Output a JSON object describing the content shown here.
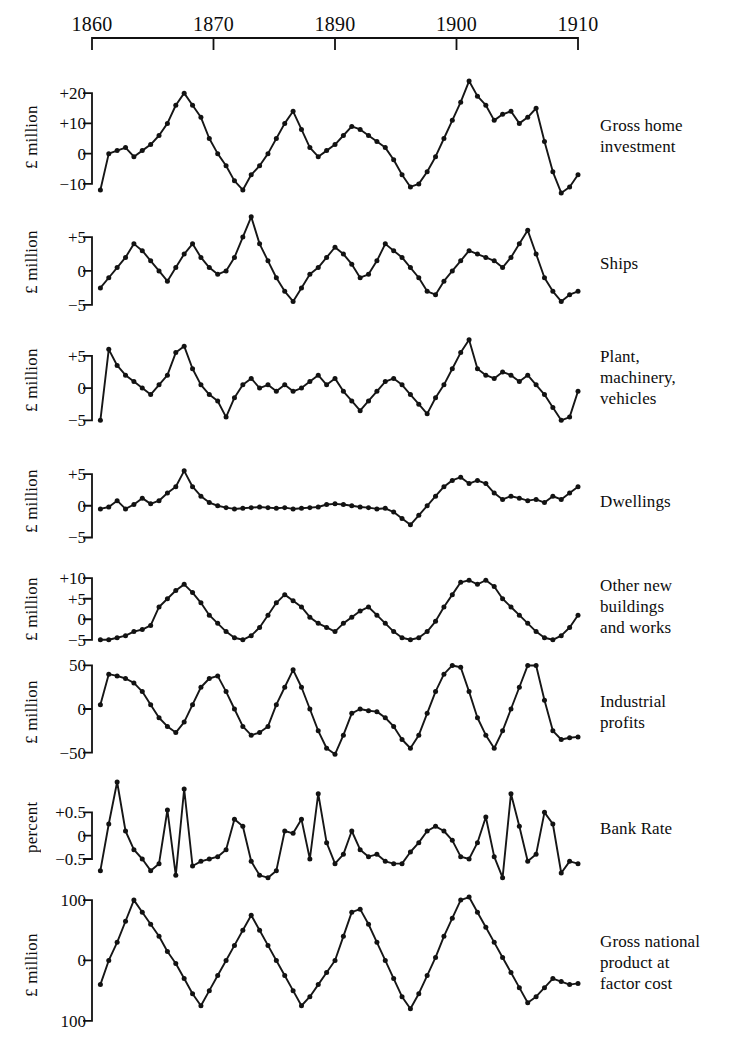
{
  "figure": {
    "background": "#ffffff",
    "ink": "#111111",
    "line_color": "#161616",
    "marker_color": "#121212"
  },
  "axis": {
    "name": "year-axis",
    "tick_labels": [
      "1860",
      "1870",
      "1890",
      "1900",
      "1910"
    ],
    "tick_years": [
      1860,
      1870,
      1880,
      1890,
      1900
    ],
    "x_start": 92,
    "x_end": 578,
    "year_min": 1855,
    "year_max": 1913
  },
  "chart_data": {
    "type": "line",
    "title": "",
    "subtitle": "",
    "xlabel": "",
    "grid": false,
    "legend": "right-of-panel",
    "shared_x_label_ticks": [
      "1860",
      "1870",
      "1890",
      "1900",
      "1910"
    ],
    "x": [
      1856,
      1857,
      1858,
      1859,
      1860,
      1861,
      1862,
      1863,
      1864,
      1865,
      1866,
      1867,
      1868,
      1869,
      1870,
      1871,
      1872,
      1873,
      1874,
      1875,
      1876,
      1877,
      1878,
      1879,
      1880,
      1881,
      1882,
      1883,
      1884,
      1885,
      1886,
      1887,
      1888,
      1889,
      1890,
      1891,
      1892,
      1893,
      1894,
      1895,
      1896,
      1897,
      1898,
      1899,
      1900,
      1901,
      1902,
      1903,
      1904,
      1905,
      1906,
      1907,
      1908,
      1909,
      1910,
      1911,
      1912,
      1913
    ],
    "panels": [
      {
        "id": "gross-home-investment",
        "label": "Gross home\ninvestment",
        "ylabel": "£ million",
        "ytick_labels": [
          "+20",
          "+10",
          "0",
          "−10"
        ],
        "ytick_values": [
          20,
          10,
          0,
          -10
        ],
        "ylim": [
          -14,
          25
        ],
        "values": [
          -12,
          0,
          1,
          2,
          -1,
          1,
          3,
          6,
          10,
          16,
          20,
          16,
          12,
          5,
          0,
          -4,
          -9,
          -12,
          -7,
          -4,
          0,
          5,
          10,
          14,
          8,
          2,
          -1,
          1,
          3,
          6,
          9,
          8,
          6,
          4,
          2,
          -2,
          -7,
          -11,
          -10,
          -6,
          -1,
          5,
          11,
          17,
          24,
          19,
          16,
          11,
          13,
          14,
          10,
          12,
          15,
          4,
          -6,
          -13,
          -11,
          -7
        ]
      },
      {
        "id": "ships",
        "label": "Ships",
        "ylabel": "£ million",
        "ytick_labels": [
          "+5",
          "0",
          "−5"
        ],
        "ytick_values": [
          5,
          0,
          -5
        ],
        "ylim": [
          -6.5,
          9
        ],
        "values": [
          -2.5,
          -1,
          0.5,
          2,
          4,
          3,
          1.5,
          0,
          -1.5,
          0.5,
          2.5,
          4,
          2,
          0.5,
          -0.5,
          0,
          2,
          5,
          8,
          4,
          1.5,
          -1,
          -3,
          -4.5,
          -2.5,
          -0.5,
          0.5,
          2,
          3.5,
          2.5,
          1,
          -1,
          -0.5,
          1.5,
          4,
          3,
          2,
          0.5,
          -1,
          -3,
          -3.5,
          -1.5,
          0,
          1.5,
          3,
          2.5,
          2,
          1.5,
          0.5,
          2,
          4,
          6,
          2.5,
          -1,
          -3,
          -4.5,
          -3.5,
          -3
        ]
      },
      {
        "id": "plant-machinery-vehicles",
        "label": "Plant,\nmachinery,\nvehicles",
        "ylabel": "£ million",
        "ytick_labels": [
          "+5",
          "0",
          "−5"
        ],
        "ytick_values": [
          5,
          0,
          -5
        ],
        "ylim": [
          -6.5,
          9
        ],
        "values": [
          -5,
          6,
          3.5,
          2,
          1,
          0,
          -1,
          0.5,
          2,
          5.5,
          6.5,
          3,
          0.5,
          -1,
          -2,
          -4.5,
          -1.5,
          0.5,
          1.5,
          0,
          0.5,
          -0.5,
          0.5,
          -0.5,
          0,
          1,
          2,
          0.5,
          1.5,
          -0.5,
          -2,
          -3.5,
          -2,
          -0.5,
          1,
          1.5,
          0.5,
          -1,
          -2.5,
          -4,
          -1.5,
          0.5,
          3,
          5.5,
          7.5,
          3,
          2,
          1.5,
          2.5,
          2,
          1,
          2,
          0.5,
          -1,
          -3,
          -5,
          -4.5,
          -0.5
        ]
      },
      {
        "id": "dwellings",
        "label": "Dwellings",
        "ylabel": "£ million",
        "ytick_labels": [
          "+5",
          "0",
          "−5"
        ],
        "ytick_values": [
          5,
          0,
          -5
        ],
        "ylim": [
          -6.5,
          8
        ],
        "values": [
          -0.5,
          -0.2,
          0.8,
          -0.5,
          0.2,
          1.2,
          0.3,
          0.8,
          2,
          3,
          5.5,
          3,
          1.5,
          0.5,
          0,
          -0.3,
          -0.5,
          -0.4,
          -0.3,
          -0.2,
          -0.3,
          -0.4,
          -0.3,
          -0.5,
          -0.4,
          -0.3,
          -0.2,
          0.2,
          0.3,
          0.2,
          0,
          -0.2,
          -0.3,
          -0.5,
          -0.4,
          -1,
          -2,
          -3,
          -1.5,
          0,
          1.5,
          3,
          4,
          4.5,
          3.5,
          4,
          3.5,
          2,
          1,
          1.5,
          1.2,
          0.8,
          1,
          0.5,
          1.5,
          1,
          2,
          3
        ]
      },
      {
        "id": "other-new-buildings-and-works",
        "label": "Other new\nbuildings\nand works",
        "ylabel": "£ million",
        "ytick_labels": [
          "+10",
          "+5",
          "0",
          "−5"
        ],
        "ytick_values": [
          10,
          5,
          0,
          -5
        ],
        "ylim": [
          -7,
          12
        ],
        "values": [
          -5,
          -5,
          -4.5,
          -4,
          -3,
          -2.5,
          -1.5,
          3,
          5,
          7,
          8.5,
          6.5,
          4,
          1,
          -1,
          -3,
          -4.5,
          -5,
          -4,
          -2,
          1,
          4,
          6,
          4.5,
          3,
          0.5,
          -1,
          -2,
          -3,
          -1,
          0.5,
          2,
          3,
          1,
          -1,
          -3,
          -4.5,
          -5,
          -4.5,
          -3,
          -0.5,
          3,
          6,
          9,
          9.5,
          8.5,
          9.5,
          8,
          5,
          3,
          1,
          -1,
          -3,
          -4.5,
          -5,
          -4,
          -2,
          1
        ]
      },
      {
        "id": "industrial-profits",
        "label": "Industrial\nprofits",
        "ylabel": "£ million",
        "ytick_labels": [
          "50",
          "0",
          "−50"
        ],
        "ytick_values": [
          50,
          0,
          -50
        ],
        "ylim": [
          -70,
          62
        ],
        "values": [
          5,
          40,
          38,
          35,
          30,
          20,
          5,
          -10,
          -20,
          -27,
          -15,
          5,
          25,
          35,
          38,
          20,
          0,
          -20,
          -30,
          -27,
          -20,
          5,
          25,
          45,
          25,
          0,
          -25,
          -45,
          -52,
          -30,
          -5,
          0,
          -2,
          -3,
          -10,
          -20,
          -35,
          -45,
          -30,
          -5,
          20,
          40,
          50,
          48,
          20,
          -10,
          -30,
          -45,
          -25,
          0,
          25,
          50,
          50,
          10,
          -25,
          -35,
          -33,
          -32
        ]
      },
      {
        "id": "bank-rate",
        "label": "Bank Rate",
        "ylabel": "percent",
        "ytick_labels": [
          "+0.5",
          "0",
          "−0.5"
        ],
        "ytick_values": [
          0.5,
          0,
          -0.5
        ],
        "ylim": [
          -0.95,
          1.3
        ],
        "values": [
          -0.75,
          0.25,
          1.15,
          0.1,
          -0.3,
          -0.5,
          -0.75,
          -0.6,
          0.55,
          -0.85,
          1.0,
          -0.65,
          -0.55,
          -0.5,
          -0.45,
          -0.3,
          0.35,
          0.2,
          -0.55,
          -0.85,
          -0.9,
          -0.75,
          0.1,
          0.05,
          0.35,
          -0.5,
          0.9,
          -0.15,
          -0.6,
          -0.4,
          0.1,
          -0.3,
          -0.45,
          -0.4,
          -0.55,
          -0.6,
          -0.6,
          -0.35,
          -0.15,
          0.1,
          0.2,
          0.1,
          -0.1,
          -0.45,
          -0.5,
          -0.15,
          0.4,
          -0.45,
          -0.9,
          0.9,
          0.2,
          -0.55,
          -0.4,
          0.5,
          0.25,
          -0.8,
          -0.55,
          -0.6
        ]
      },
      {
        "id": "gross-national-product-at-factor-cost",
        "label": "Gross national\nproduct at\nfactor cost",
        "ylabel": "£ million",
        "ytick_labels": [
          "100",
          "0",
          "100"
        ],
        "ytick_values": [
          100,
          0,
          -100
        ],
        "ylim": [
          -140,
          125
        ],
        "values": [
          -40,
          0,
          30,
          65,
          100,
          80,
          60,
          40,
          15,
          -5,
          -30,
          -55,
          -75,
          -50,
          -25,
          0,
          25,
          50,
          75,
          50,
          25,
          0,
          -25,
          -50,
          -75,
          -60,
          -40,
          -20,
          0,
          40,
          80,
          85,
          60,
          30,
          0,
          -30,
          -60,
          -80,
          -55,
          -25,
          5,
          40,
          70,
          100,
          105,
          80,
          55,
          30,
          5,
          -20,
          -45,
          -70,
          -60,
          -45,
          -30,
          -35,
          -40,
          -38
        ]
      }
    ]
  }
}
